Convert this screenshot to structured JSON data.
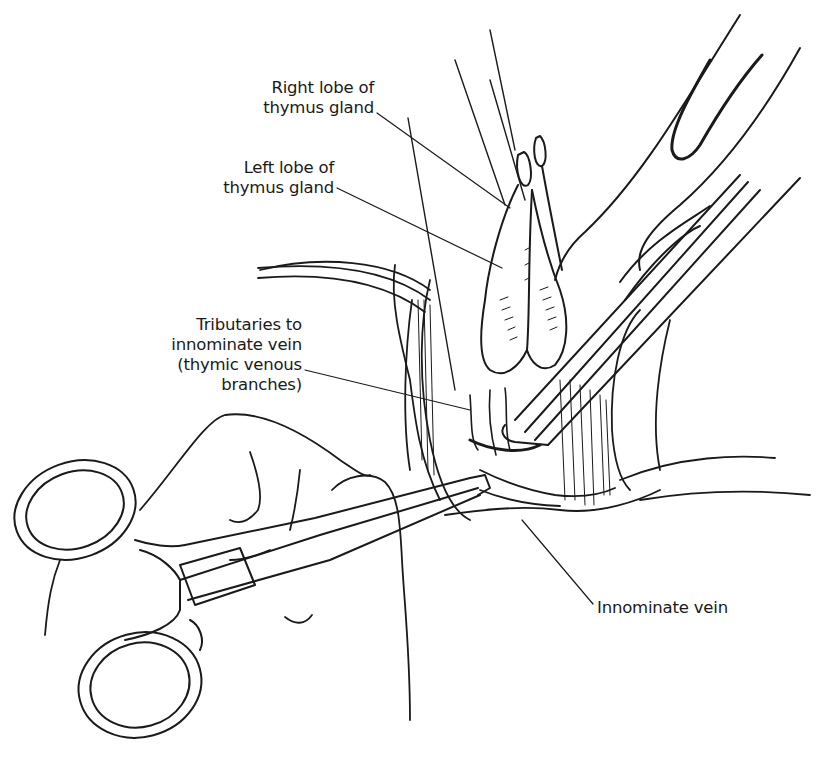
{
  "figure": {
    "labels": [
      {
        "id": "right-lobe",
        "lines": [
          "Right lobe of",
          "thymus gland"
        ]
      },
      {
        "id": "left-lobe",
        "lines": [
          "Left lobe of",
          "thymus gland"
        ]
      },
      {
        "id": "tributaries",
        "lines": [
          "Tributaries to",
          "innominate vein",
          "(thymic venous branches)"
        ]
      },
      {
        "id": "innominate",
        "lines": [
          "Innominate vein"
        ]
      }
    ],
    "instruments": [
      "hemostat-clamp",
      "retractor",
      "forceps"
    ],
    "colors": {
      "ink": "#1a1a1a",
      "background": "#ffffff"
    }
  }
}
